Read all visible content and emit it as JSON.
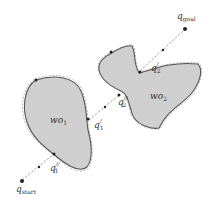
{
  "diagram": {
    "title": "",
    "labels": {
      "q_start": {
        "base": "q",
        "sub": "start"
      },
      "q_goal": {
        "base": "q",
        "sub": "goal"
      },
      "q1_prime": {
        "base": "q",
        "sub": "1",
        "sup": "/"
      },
      "q1_dprime": {
        "base": "q",
        "sub": "1",
        "sup": "//"
      },
      "q2_prime": {
        "base": "q",
        "sub": "2",
        "sup": "/"
      },
      "q2_dprime": {
        "base": "q",
        "sub": "2",
        "sup": "//"
      },
      "wo1": {
        "base": "wo",
        "sub": "1"
      },
      "wo2": {
        "base": "wo",
        "sub": "2"
      }
    },
    "colors": {
      "obstacle_fill": "#cfcfcf",
      "obstacle_stroke": "#555555",
      "path": "#999999",
      "point": "#222222"
    }
  }
}
